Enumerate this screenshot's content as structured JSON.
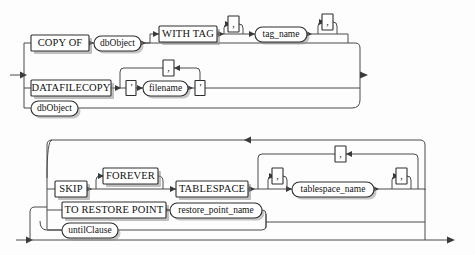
{
  "diagram": {
    "type": "railroad-syntax-diagram",
    "title": "",
    "line_color": "#4a4a4a",
    "box_border_color": "#2e2e2e",
    "shadow_color": "#8d8d8d",
    "background_color": "#fdfdfd",
    "text_color": "#111111"
  },
  "panels": [
    {
      "id": "panel-top",
      "name": "copy-of-datafilecopy-panel",
      "terminals": [
        {
          "id": "copy-of",
          "label": "COPY OF",
          "shape": "rect",
          "x": 31,
          "y": 35,
          "w": 58,
          "h": 16
        },
        {
          "id": "with-tag",
          "label": "WITH TAG",
          "shape": "rect",
          "x": 159,
          "y": 26,
          "w": 58,
          "h": 16
        },
        {
          "id": "datafilecopy",
          "label": "DATAFILECOPY",
          "shape": "rect",
          "x": 31,
          "y": 80,
          "w": 80,
          "h": 16
        }
      ],
      "nonterminals": [
        {
          "id": "dbobject-1",
          "label": "dbObject",
          "shape": "oval",
          "x": 94,
          "y": 35,
          "w": 47,
          "h": 15
        },
        {
          "id": "tag-name",
          "label": "tag_name",
          "shape": "oval",
          "x": 255,
          "y": 26,
          "w": 52,
          "h": 15
        },
        {
          "id": "filename",
          "label": "filename",
          "shape": "oval",
          "x": 143,
          "y": 84,
          "w": 45,
          "h": 15
        },
        {
          "id": "dbobject-2",
          "label": "dbObject",
          "shape": "oval",
          "x": 31,
          "y": 100,
          "w": 47,
          "h": 15
        }
      ],
      "punctuation": [
        {
          "id": "comma-tag-loop",
          "label": ",",
          "x": 228,
          "y": 8,
          "w": 11,
          "h": 16
        },
        {
          "id": "comma-tag-after",
          "label": ",",
          "x": 322,
          "y": 6,
          "w": 11,
          "h": 16
        },
        {
          "id": "comma-filename-loop",
          "label": ",",
          "x": 163,
          "y": 64,
          "w": 11,
          "h": 16
        },
        {
          "id": "quote-open",
          "label": "'",
          "x": 126,
          "y": 84,
          "w": 10,
          "h": 15
        },
        {
          "id": "quote-close",
          "label": "'",
          "x": 195,
          "y": 84,
          "w": 10,
          "h": 15
        }
      ],
      "entry_arrow": {
        "x": 15,
        "y": 75
      },
      "exit_arrow": {
        "x": 366,
        "y": 75
      }
    },
    {
      "id": "panel-bottom",
      "name": "skip-tablespace-panel",
      "terminals": [
        {
          "id": "skip",
          "label": "SKIP",
          "shape": "rect",
          "x": 55,
          "y": 181,
          "w": 32,
          "h": 16
        },
        {
          "id": "forever",
          "label": "FOREVER",
          "shape": "rect",
          "x": 103,
          "y": 168,
          "w": 55,
          "h": 16
        },
        {
          "id": "tablespace",
          "label": "TABLESPACE",
          "shape": "rect",
          "x": 176,
          "y": 181,
          "w": 72,
          "h": 16
        },
        {
          "id": "to-restore-point",
          "label": "TO RESTORE POINT",
          "shape": "rect",
          "x": 62,
          "y": 202,
          "w": 104,
          "h": 16
        }
      ],
      "nonterminals": [
        {
          "id": "tablespace-name",
          "label": "tablespace_name",
          "shape": "oval",
          "x": 292,
          "y": 181,
          "w": 82,
          "h": 15
        },
        {
          "id": "restore-point-name",
          "label": "restore_point_name",
          "shape": "oval",
          "x": 170,
          "y": 202,
          "w": 92,
          "h": 15
        },
        {
          "id": "until-clause",
          "label": "untilClause",
          "shape": "oval",
          "x": 62,
          "y": 222,
          "w": 56,
          "h": 15
        }
      ],
      "punctuation": [
        {
          "id": "comma-ts-outer-loop",
          "label": ",",
          "x": 335,
          "y": 146,
          "w": 11,
          "h": 16
        },
        {
          "id": "comma-ts-before",
          "label": ",",
          "x": 272,
          "y": 165,
          "w": 11,
          "h": 16
        },
        {
          "id": "comma-ts-after",
          "label": ",",
          "x": 396,
          "y": 165,
          "w": 11,
          "h": 16
        }
      ],
      "entry_arrow": {
        "x": 22,
        "y": 240
      },
      "exit_arrow": {
        "x": 455,
        "y": 240
      },
      "top_loop_arrow": {
        "x": 245,
        "y": 139
      }
    }
  ],
  "labels": {
    "copy_of": "COPY OF",
    "with_tag": "WITH TAG",
    "datafilecopy": "DATAFILECOPY",
    "db_object_1": "dbObject",
    "db_object_2": "dbObject",
    "tag_name": "tag_name",
    "filename": "filename",
    "skip": "SKIP",
    "forever": "FOREVER",
    "tablespace": "TABLESPACE",
    "to_restore_point": "TO RESTORE POINT",
    "tablespace_name": "tablespace_name",
    "restore_point_name": "restore_point_name",
    "until_clause": "untilClause",
    "comma": ",",
    "quote": "'"
  }
}
